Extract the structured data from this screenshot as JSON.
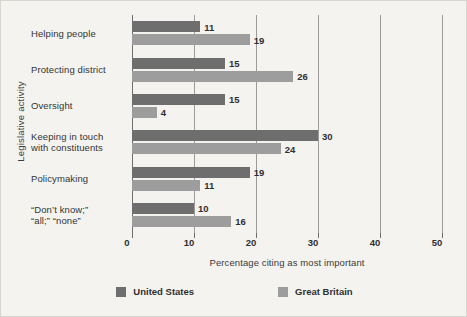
{
  "chart_data": {
    "type": "bar",
    "orientation": "horizontal",
    "title": "",
    "xlabel": "Percentage citing as most important",
    "ylabel": "Legislative activity",
    "xlim": [
      0,
      50
    ],
    "xticks": [
      0,
      10,
      20,
      30,
      40,
      50
    ],
    "grid": "vertical",
    "legend_position": "bottom",
    "categories": [
      "Helping people",
      "Protecting district",
      "Oversight",
      "Keeping in touch\nwith constituents",
      "Policymaking",
      "“Don’t know;”\n“all;” “none”"
    ],
    "series": [
      {
        "name": "United States",
        "color": "#6e6e6e",
        "values": [
          11,
          15,
          15,
          30,
          19,
          10
        ]
      },
      {
        "name": "Great Britain",
        "color": "#9d9d9d",
        "values": [
          19,
          26,
          4,
          24,
          11,
          16
        ]
      }
    ]
  },
  "axis": {
    "y_title": "Legislative activity",
    "x_title": "Percentage citing as most important",
    "tick_labels": [
      "0",
      "10",
      "20",
      "30",
      "40",
      "50"
    ]
  },
  "categories": [
    {
      "line1": "Helping people",
      "line2": ""
    },
    {
      "line1": "Protecting district",
      "line2": ""
    },
    {
      "line1": "Oversight",
      "line2": ""
    },
    {
      "line1": "Keeping in touch",
      "line2": "with constituents"
    },
    {
      "line1": "Policymaking",
      "line2": ""
    },
    {
      "line1": "“Don’t know;”",
      "line2": "“all;” “none”"
    }
  ],
  "values": {
    "us": [
      "11",
      "15",
      "15",
      "30",
      "19",
      "10"
    ],
    "gb": [
      "19",
      "26",
      "4",
      "24",
      "11",
      "16"
    ]
  },
  "legend": [
    {
      "label": "United States",
      "color": "#6e6e6e"
    },
    {
      "label": "Great Britain",
      "color": "#9d9d9d"
    }
  ]
}
